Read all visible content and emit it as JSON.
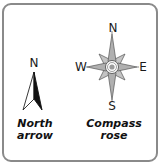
{
  "north_arrow": {
    "label": "N",
    "caption_line1": "North",
    "caption_line2": "arrow"
  },
  "compass_rose": {
    "north": "N",
    "south": "S",
    "east": "E",
    "west": "W",
    "caption_line1": "Compass",
    "caption_line2": "rose"
  },
  "colors": {
    "frame_border": "#8a8a8a",
    "rose_fill": "#b8b8b8",
    "rose_stroke": "#555555",
    "arrow_fill": "#111111"
  }
}
